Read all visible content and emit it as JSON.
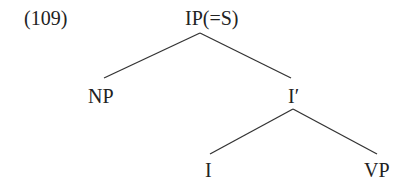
{
  "example_number": "(109)",
  "tree": {
    "root": {
      "label": "IP(=S)"
    },
    "np": {
      "label": "NP"
    },
    "i_bar": {
      "label": "I′"
    },
    "i": {
      "label": "I"
    },
    "vp": {
      "label": "VP"
    }
  },
  "edges": [
    {
      "from": "IP(=S)",
      "to": "NP"
    },
    {
      "from": "IP(=S)",
      "to": "I′"
    },
    {
      "from": "I′",
      "to": "I"
    },
    {
      "from": "I′",
      "to": "VP"
    }
  ]
}
